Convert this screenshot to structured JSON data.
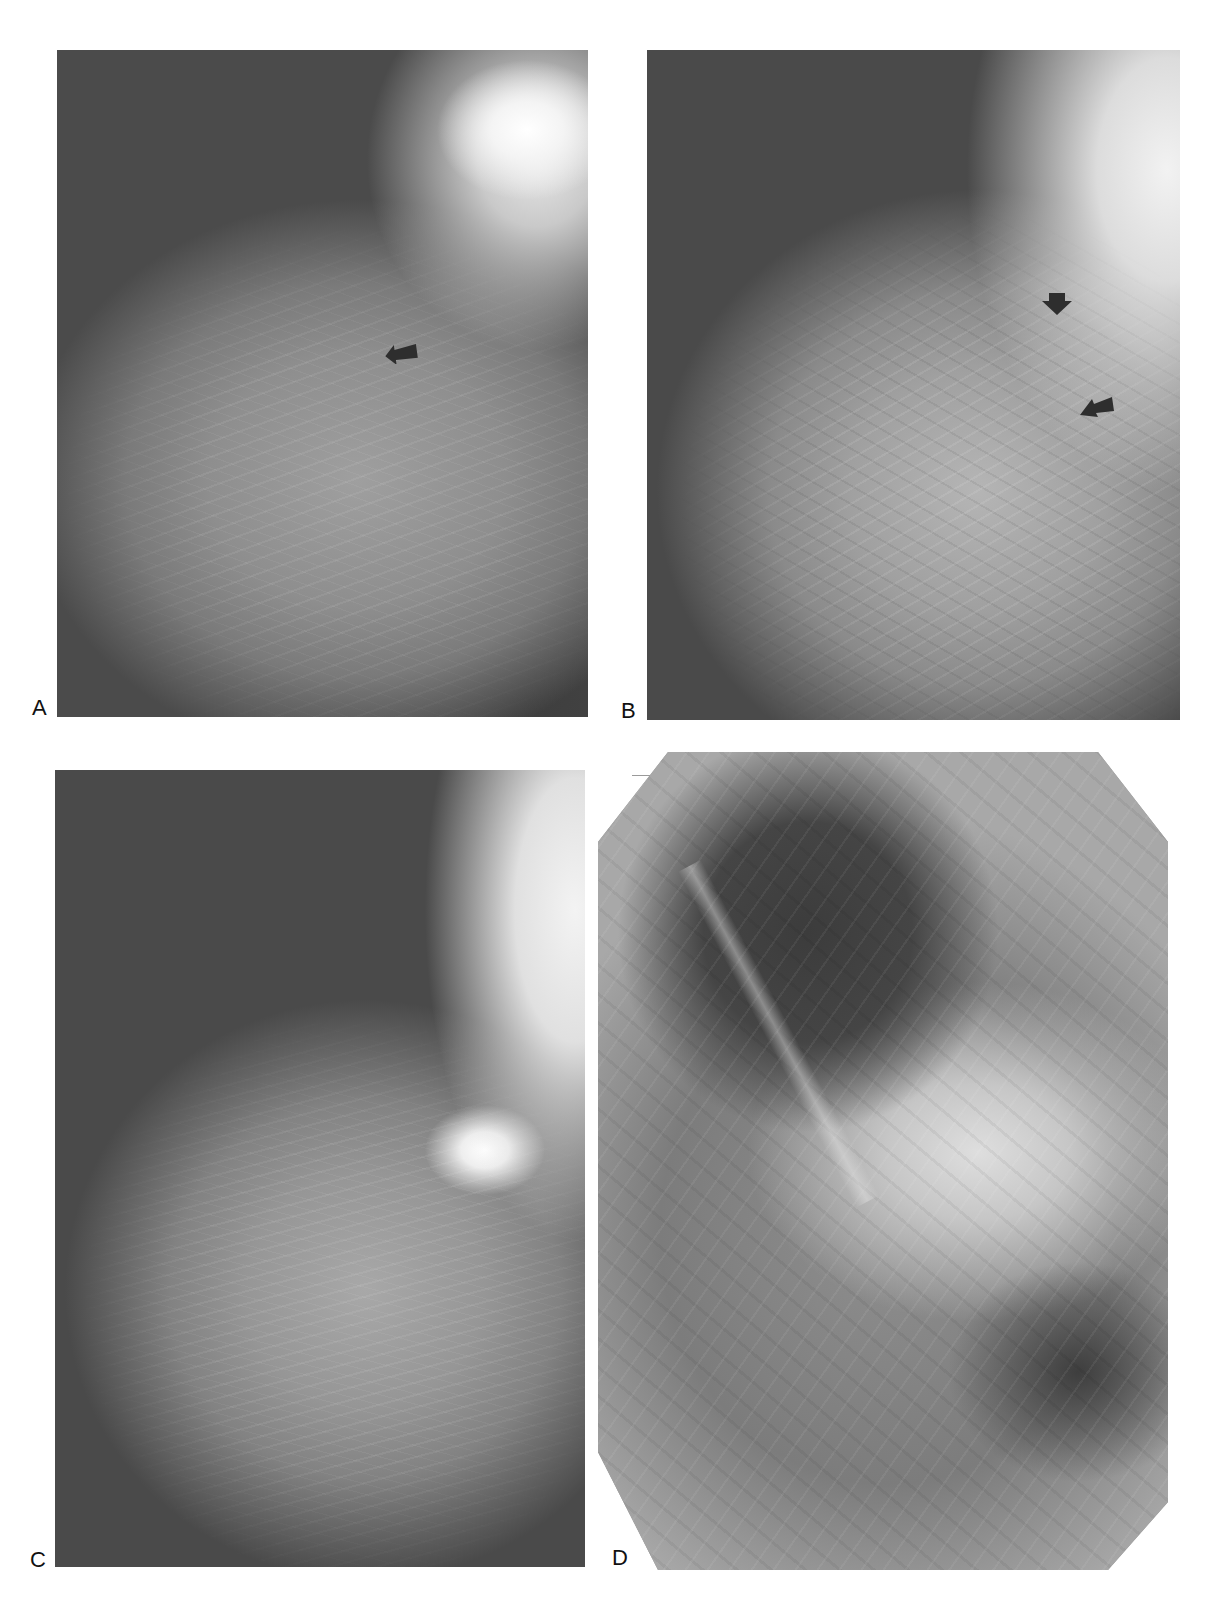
{
  "figure": {
    "type": "multi-panel mammogram figure",
    "panels": [
      {
        "id": "A",
        "label": "A",
        "arrows": 1
      },
      {
        "id": "B",
        "label": "B",
        "arrows": 2
      },
      {
        "id": "C",
        "label": "C",
        "arrows": 0
      },
      {
        "id": "D",
        "label": "D",
        "arrows": 0
      }
    ]
  },
  "colors": {
    "background": "#ffffff",
    "label_text": "#111111",
    "arrow_fill": "#2e2e2e",
    "film_dark": "#4a4a4a"
  }
}
